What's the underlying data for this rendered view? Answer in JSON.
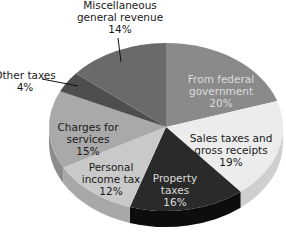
{
  "chart_data": {
    "type": "pie",
    "title": "",
    "style": "3d-pie",
    "slices": [
      {
        "label": "From federal government",
        "lines": [
          "From federal",
          "government",
          "20%"
        ],
        "value": 20,
        "color": "#8a8a8a",
        "side": "#6e6e6e",
        "text": "light"
      },
      {
        "label": "Sales taxes and gross receipts",
        "lines": [
          "Sales taxes and",
          "gross receipts",
          "19%"
        ],
        "value": 19,
        "color": "#ececec",
        "side": "#cfcfcf",
        "text": "dark"
      },
      {
        "label": "Property taxes",
        "lines": [
          "Property",
          "taxes",
          "16%"
        ],
        "value": 16,
        "color": "#2a2a2a",
        "side": "#0d0d0d",
        "text": "light"
      },
      {
        "label": "Personal income tax",
        "lines": [
          "Personal",
          "income tax",
          "12%"
        ],
        "value": 12,
        "color": "#c9c9c9",
        "side": "#a8a8a8",
        "text": "dark"
      },
      {
        "label": "Charges for services",
        "lines": [
          "Charges for",
          "services",
          "15%"
        ],
        "value": 15,
        "color": "#a9a9a9",
        "side": "#8c8c8c",
        "text": "dark"
      },
      {
        "label": "Other taxes",
        "lines": [
          "Other taxes",
          "4%"
        ],
        "value": 4,
        "color": "#4e4e4e",
        "side": "#3a3a3a",
        "text": "dark",
        "callout": true
      },
      {
        "label": "Miscellaneous general revenue",
        "lines": [
          "Miscellaneous",
          "general revenue",
          "14%"
        ],
        "value": 14,
        "color": "#6a6a6a",
        "side": "#555555",
        "text": "dark",
        "callout": true
      }
    ],
    "legend": null
  },
  "labels": {
    "federal": [
      "From federal",
      "government",
      "20%"
    ],
    "sales": [
      "Sales taxes and",
      "gross receipts",
      "19%"
    ],
    "property": [
      "Property",
      "taxes",
      "16%"
    ],
    "income": [
      "Personal",
      "income tax",
      "12%"
    ],
    "charges": [
      "Charges for",
      "services",
      "15%"
    ],
    "other": [
      "Other taxes",
      "4%"
    ],
    "misc": [
      "Miscellaneous",
      "general revenue",
      "14%"
    ]
  }
}
